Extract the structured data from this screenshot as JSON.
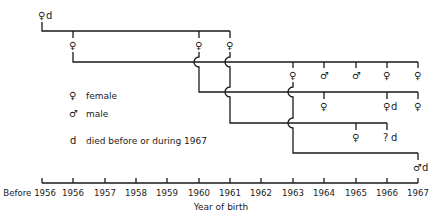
{
  "legend": {
    "female_symbol": "♀",
    "female_label": "female",
    "male_symbol": "♂",
    "male_label": "male",
    "died_symbol": "d",
    "died_label": "died before or during 1967"
  },
  "axis": {
    "title": "Year of birth",
    "ticks": [
      "Before 1956",
      "1956",
      "1957",
      "1958",
      "1959",
      "1960",
      "1961",
      "1962",
      "1963",
      "1964",
      "1965",
      "1966",
      "1967"
    ]
  },
  "nodes": {
    "root": {
      "symbol": "♀",
      "mark": "d",
      "year": "Before 1956"
    },
    "g1_1956": {
      "symbol": "♀",
      "year": "1956"
    },
    "g1_1960": {
      "symbol": "♀",
      "year": "1960"
    },
    "g1_1961": {
      "symbol": "♀",
      "year": "1961"
    },
    "r2_1963": {
      "symbol": "♀",
      "year": "1963"
    },
    "r2_1964": {
      "symbol": "♂",
      "year": "1964"
    },
    "r2_1965": {
      "symbol": "♂",
      "year": "1965"
    },
    "r2_1966": {
      "symbol": "♀",
      "year": "1966"
    },
    "r2_1967": {
      "symbol": "♀",
      "year": "1967"
    },
    "r3_1964": {
      "symbol": "♀",
      "year": "1964"
    },
    "r3_1966": {
      "symbol": "♀",
      "mark": "d",
      "year": "1966"
    },
    "r3_1967": {
      "symbol": "♀",
      "year": "1967"
    },
    "r4_1965": {
      "symbol": "♀",
      "year": "1965"
    },
    "r4_1966": {
      "symbol": "?",
      "mark": "d",
      "year": "1966"
    },
    "r5_1967": {
      "symbol": "♂",
      "mark": "d",
      "year": "1967"
    }
  }
}
